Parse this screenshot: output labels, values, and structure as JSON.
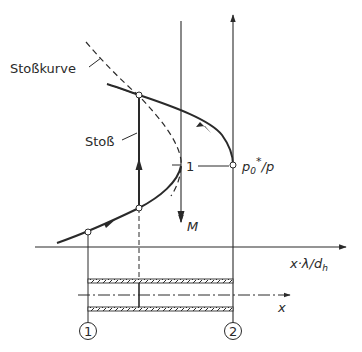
{
  "diagram": {
    "labels": {
      "shock_curve": "Stoßkurve",
      "shock": "Stoß",
      "mach_axis": "M",
      "pressure_axis_main": "p",
      "pressure_axis_sub": "0",
      "pressure_axis_sup": "*",
      "pressure_axis_tail": "/p",
      "unity_mark": "1",
      "friction_axis_main": "x·λ/d",
      "friction_axis_sub": "h",
      "pipe_axis": "x",
      "station_1": "1",
      "station_2": "2"
    },
    "colors": {
      "ink": "#2a2a2a",
      "background": "#ffffff"
    }
  }
}
